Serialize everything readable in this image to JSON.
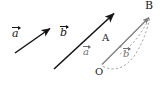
{
  "figure": {
    "background": "#ffffff",
    "colors": {
      "free_vector": "#151515",
      "construction": "#7b7b7b",
      "dashed": "#9a9a9a",
      "label": "#1a1a1a"
    },
    "points": [
      {
        "id": "O",
        "label": "O",
        "x": 101,
        "y": 68
      },
      {
        "id": "A",
        "label": "A",
        "x": 123,
        "y": 52
      },
      {
        "id": "B",
        "label": "B",
        "x": 151,
        "y": 15
      }
    ],
    "labels": {
      "vector_a_free": "a",
      "vector_b_free": "b",
      "vector_a_oa": "a",
      "vector_b_ab": "b",
      "point_O": "O",
      "point_A": "A",
      "point_B": "B"
    },
    "arrows": [
      {
        "name": "free-vector-a",
        "from_x": 16,
        "from_y": 52,
        "to_x": 52,
        "to_y": 27,
        "style": "solid",
        "color": "#151515"
      },
      {
        "name": "free-vector-b",
        "from_x": 55,
        "from_y": 68,
        "to_x": 116,
        "to_y": 12,
        "style": "solid",
        "color": "#151515"
      },
      {
        "name": "resultant-OB",
        "from_x": 101,
        "from_y": 64,
        "to_x": 150,
        "to_y": 17,
        "style": "solid",
        "color": "#7b7b7b"
      }
    ],
    "dashed_curves": [
      {
        "name": "curve-OA-to-B",
        "color": "#9a9a9a"
      },
      {
        "name": "curve-B-to-A",
        "color": "#9a9a9a"
      }
    ]
  }
}
